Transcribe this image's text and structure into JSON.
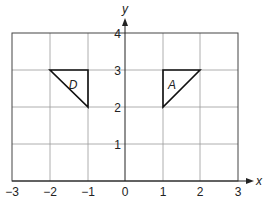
{
  "diagram": {
    "type": "coordinate-grid",
    "x_axis": {
      "label": "x",
      "min": -3,
      "max": 3,
      "ticks": [
        "−3",
        "−2",
        "−1",
        "0",
        "1",
        "2",
        "3"
      ]
    },
    "y_axis": {
      "label": "y",
      "min": 0,
      "max": 4,
      "ticks": [
        "1",
        "2",
        "3",
        "4"
      ]
    },
    "shapes": [
      {
        "label": "D",
        "vertices": [
          [
            -2,
            3
          ],
          [
            -1,
            3
          ],
          [
            -1,
            2
          ]
        ]
      },
      {
        "label": "A",
        "vertices": [
          [
            1,
            3
          ],
          [
            2,
            3
          ],
          [
            1,
            2
          ]
        ]
      }
    ]
  }
}
